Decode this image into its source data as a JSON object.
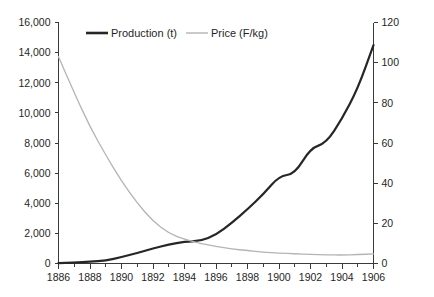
{
  "chart_data": {
    "type": "line",
    "title": "",
    "subtitle": "",
    "xlabel": "",
    "ylabel": "",
    "grid": false,
    "legend_position": "top-center",
    "x": [
      1886,
      1887,
      1888,
      1889,
      1890,
      1891,
      1892,
      1893,
      1894,
      1895,
      1896,
      1897,
      1898,
      1899,
      1900,
      1901,
      1902,
      1903,
      1904,
      1905,
      1906
    ],
    "x_tick_labels": [
      "1886",
      "1888",
      "1890",
      "1892",
      "1894",
      "1896",
      "1898",
      "1900",
      "1902",
      "1904",
      "1906"
    ],
    "x_tick_values": [
      1886,
      1888,
      1890,
      1892,
      1894,
      1896,
      1898,
      1900,
      1902,
      1904,
      1906
    ],
    "xlim": [
      1886,
      1906
    ],
    "axes": [
      {
        "id": "left",
        "name": "production-axis",
        "label": "",
        "ylim": [
          0,
          16000
        ],
        "ticks": [
          0,
          2000,
          4000,
          6000,
          8000,
          10000,
          12000,
          14000,
          16000
        ],
        "tick_labels": [
          "0",
          "2,000",
          "4,000",
          "6,000",
          "8,000",
          "10,000",
          "12,000",
          "14,000",
          "16,000"
        ]
      },
      {
        "id": "right",
        "name": "price-axis",
        "label": "",
        "ylim": [
          0,
          120
        ],
        "ticks": [
          0,
          20,
          40,
          60,
          80,
          100,
          120
        ],
        "tick_labels": [
          "0",
          "20",
          "40",
          "60",
          "80",
          "100",
          "120"
        ]
      }
    ],
    "series": [
      {
        "name": "Production (t)",
        "axis": "left",
        "color": "#262626",
        "width": 2.2,
        "values": [
          30,
          60,
          110,
          200,
          420,
          700,
          1000,
          1250,
          1450,
          1480,
          1900,
          2700,
          3600,
          4600,
          5800,
          5950,
          7650,
          8000,
          9600,
          11600,
          14500
        ]
      },
      {
        "name": "Price (F/kg)",
        "axis": "right",
        "color": "#b4b4b4",
        "width": 1.3,
        "values": [
          103,
          85,
          68,
          54,
          41,
          30,
          21,
          15,
          12,
          10,
          8.5,
          7.3,
          6.4,
          5.7,
          5.2,
          4.8,
          4.5,
          4.3,
          4.2,
          4.4,
          4.8
        ]
      }
    ],
    "legend": [
      {
        "label": "Production (t)",
        "color": "#262626",
        "width": 2.6,
        "swatch": "line-swatch"
      },
      {
        "label": "Price (F/kg)",
        "color": "#b4b4b4",
        "width": 1.4,
        "swatch": "line-swatch"
      }
    ]
  }
}
